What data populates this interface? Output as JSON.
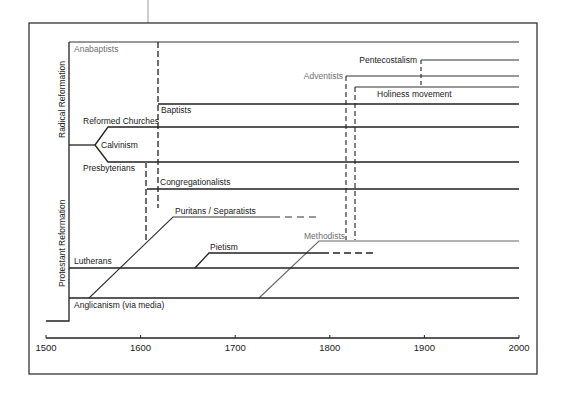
{
  "diagram": {
    "axis": {
      "ticks": [
        "1500",
        "1600",
        "1700",
        "1800",
        "1900",
        "2000"
      ],
      "range": [
        1500,
        2000
      ]
    },
    "side_labels": {
      "radical": "Radical Reformation",
      "protestant": "Protestant Reformation"
    },
    "branches": [
      {
        "id": "anabaptists",
        "label": "Anabaptists",
        "start": 1525,
        "style": "grey-label"
      },
      {
        "id": "pentecostalism",
        "label": "Pentecostalism",
        "start": 1900
      },
      {
        "id": "adventists",
        "label": "Adventists",
        "start": 1820,
        "style": "grey-label"
      },
      {
        "id": "holiness",
        "label": "Holiness movement",
        "start": 1830
      },
      {
        "id": "baptists",
        "label": "Baptists",
        "start": 1620
      },
      {
        "id": "reformed",
        "label": "Reformed Churches",
        "start": 1545
      },
      {
        "id": "calvinism",
        "label": "Calvinism",
        "start": 1525
      },
      {
        "id": "presbyterians",
        "label": "Presbyterians",
        "start": 1545
      },
      {
        "id": "congregationalists",
        "label": "Congregationalists",
        "start": 1605
      },
      {
        "id": "puritans",
        "label": "Puritans / Separatists",
        "start": 1630,
        "end": 1790
      },
      {
        "id": "methodists",
        "label": "Methodists",
        "start": 1785,
        "style": "grey-label"
      },
      {
        "id": "pietism",
        "label": "Pietism",
        "start": 1660,
        "end": 1850
      },
      {
        "id": "lutherans",
        "label": "Lutherans",
        "start": 1525
      },
      {
        "id": "anglicanism",
        "label": "Anglicanism (via media)",
        "start": 1525
      }
    ]
  }
}
